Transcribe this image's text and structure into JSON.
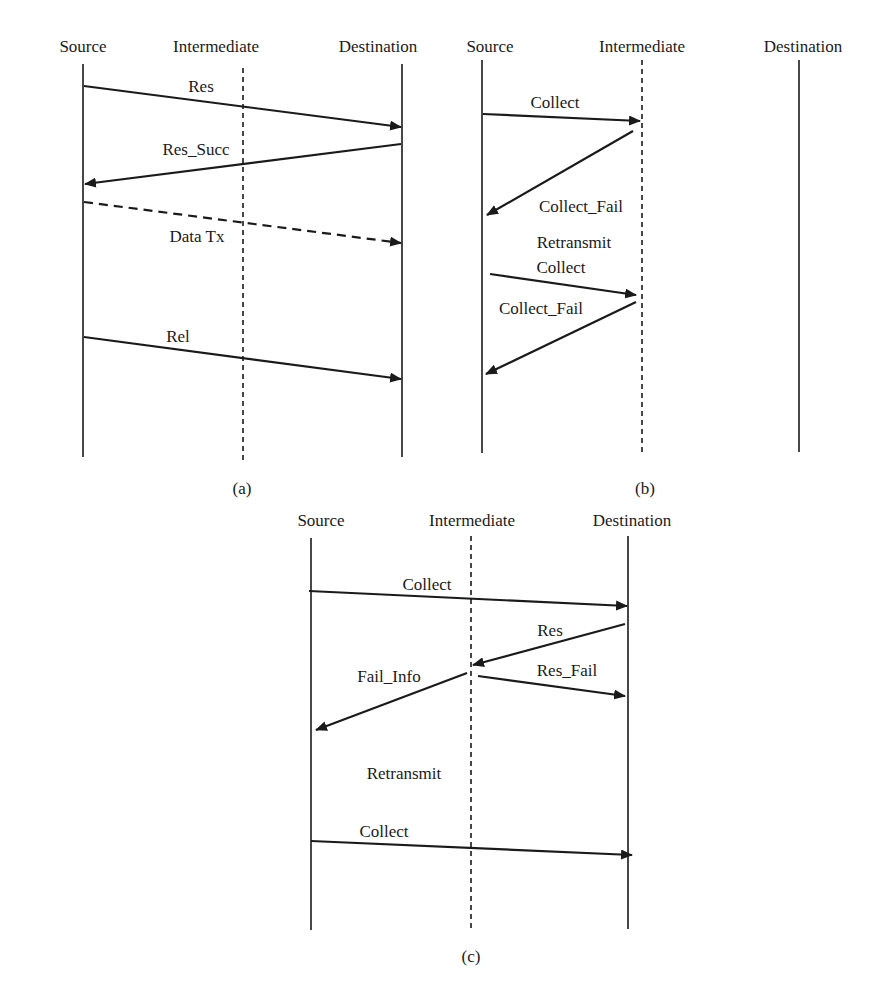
{
  "colors": {
    "ink": "#1a1a1a",
    "background": "#ffffff"
  },
  "panels": [
    {
      "id": "a",
      "caption": "(a)",
      "lifelines": [
        {
          "name": "Source",
          "x": 83,
          "style": "solid"
        },
        {
          "name": "Intermediate",
          "x": 243,
          "style": "dashed"
        },
        {
          "name": "Destination",
          "x": 402,
          "style": "solid"
        }
      ],
      "messages": [
        {
          "label": "Res",
          "from": "Source",
          "to": "Destination",
          "style": "solid"
        },
        {
          "label": "Res_Succ",
          "from": "Destination",
          "to": "Source",
          "style": "solid"
        },
        {
          "label": "Data Tx",
          "from": "Source",
          "to": "Destination",
          "style": "dashed"
        },
        {
          "label": "Rel",
          "from": "Source",
          "to": "Destination",
          "style": "solid"
        }
      ]
    },
    {
      "id": "b",
      "caption": "(b)",
      "lifelines": [
        {
          "name": "Source",
          "x": 482,
          "style": "solid"
        },
        {
          "name": "Intermediate",
          "x": 641,
          "style": "dashed"
        },
        {
          "name": "Destination",
          "x": 799,
          "style": "solid"
        }
      ],
      "messages": [
        {
          "label": "Collect",
          "from": "Source",
          "to": "Intermediate",
          "style": "solid"
        },
        {
          "label": "Collect_Fail",
          "from": "Intermediate",
          "to": "Source",
          "style": "solid"
        },
        {
          "label": "Retransmit",
          "from": "",
          "to": "",
          "style": "note"
        },
        {
          "label": "Collect",
          "from": "Source",
          "to": "Intermediate",
          "style": "solid"
        },
        {
          "label": "Collect_Fail",
          "from": "Intermediate",
          "to": "Source",
          "style": "solid"
        }
      ]
    },
    {
      "id": "c",
      "caption": "(c)",
      "lifelines": [
        {
          "name": "Source",
          "x": 311,
          "style": "solid"
        },
        {
          "name": "Intermediate",
          "x": 471,
          "style": "dashed"
        },
        {
          "name": "Destination",
          "x": 628,
          "style": "solid"
        }
      ],
      "messages": [
        {
          "label": "Collect",
          "from": "Source",
          "to": "Destination",
          "style": "solid"
        },
        {
          "label": "Res",
          "from": "Destination",
          "to": "Intermediate",
          "style": "solid"
        },
        {
          "label": "Fail_Info",
          "from": "Intermediate",
          "to": "Source",
          "style": "solid"
        },
        {
          "label": "Res_Fail",
          "from": "Intermediate",
          "to": "Destination",
          "style": "solid"
        },
        {
          "label": "Retransmit",
          "from": "",
          "to": "",
          "style": "note"
        },
        {
          "label": "Collect",
          "from": "Source",
          "to": "Destination",
          "style": "solid"
        }
      ]
    }
  ]
}
